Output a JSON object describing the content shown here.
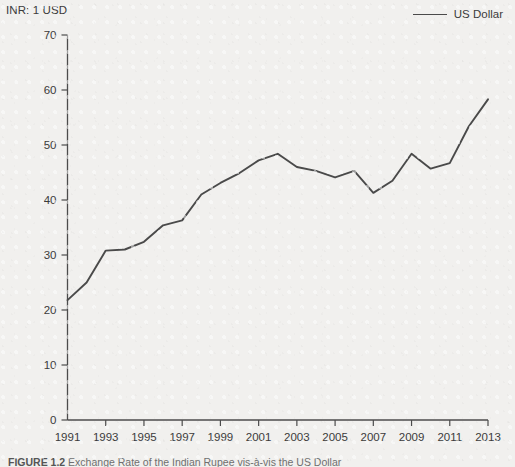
{
  "figure": {
    "y_axis_title": "INR: 1 USD",
    "caption_label": "FIGURE 1.2",
    "caption_text": "Exchange Rate of the Indian Rupee vis-à-vis the US Dollar",
    "background_color": "#f1f0ee"
  },
  "legend": {
    "position": "top-right",
    "entries": [
      {
        "label": "US Dollar",
        "color": "#4a4a4a",
        "icon": "line-swatch"
      }
    ]
  },
  "chart_data": {
    "type": "line",
    "title": "",
    "subtitle": "",
    "xlabel": "",
    "ylabel": "INR: 1 USD",
    "grid": false,
    "legend_position": "top-right",
    "xlim": [
      1991,
      2013
    ],
    "ylim": [
      0,
      70
    ],
    "yticks": [
      0,
      10,
      20,
      30,
      40,
      50,
      60,
      70
    ],
    "ytick_labels": [
      "0",
      "10",
      "20",
      "30",
      "40",
      "50",
      "60",
      "70"
    ],
    "xticks": [
      1991,
      1993,
      1995,
      1997,
      1999,
      2001,
      2003,
      2005,
      2007,
      2009,
      2011,
      2013
    ],
    "xtick_labels": [
      "1991",
      "1993",
      "1995",
      "1997",
      "1999",
      "2001",
      "2003",
      "2005",
      "2007",
      "2009",
      "2011",
      "2013"
    ],
    "x": [
      1991,
      1992,
      1993,
      1994,
      1995,
      1996,
      1997,
      1998,
      1999,
      2000,
      2001,
      2002,
      2003,
      2004,
      2005,
      2006,
      2007,
      2008,
      2009,
      2010,
      2011,
      2012,
      2013
    ],
    "series": [
      {
        "name": "US Dollar",
        "color": "#4a4a4a",
        "values": [
          21.8,
          25.0,
          30.8,
          31.0,
          32.4,
          35.4,
          36.3,
          41.0,
          43.1,
          44.9,
          47.2,
          48.4,
          46.0,
          45.3,
          44.1,
          45.3,
          41.3,
          43.5,
          48.4,
          45.7,
          46.7,
          53.4,
          58.3
        ]
      }
    ]
  }
}
